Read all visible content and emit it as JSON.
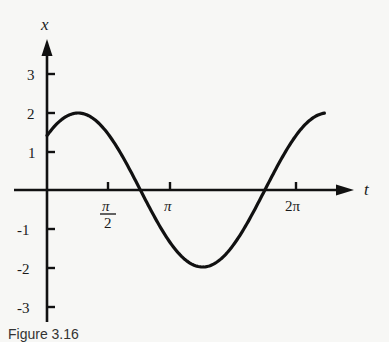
{
  "chart_data": {
    "type": "line",
    "title": "",
    "xlabel": "t",
    "ylabel": "x",
    "function": "x = 2cos(t - π/4)",
    "x_tick_labels": [
      "π/2",
      "π",
      "2π"
    ],
    "x_tick_values": [
      1.5708,
      3.1416,
      6.2832
    ],
    "y_tick_labels": [
      "3",
      "2",
      "1",
      "-1",
      "-2",
      "-3"
    ],
    "y_tick_values": [
      3,
      2,
      1,
      -1,
      -2,
      -3
    ],
    "xlim": [
      0,
      7.1
    ],
    "ylim": [
      -3,
      3.5
    ],
    "grid": false,
    "legend": null,
    "series": [
      {
        "name": "x(t)",
        "x": [
          0,
          0.3927,
          0.7854,
          1.1781,
          1.5708,
          1.9635,
          2.3562,
          2.7489,
          3.1416,
          3.5343,
          3.927,
          4.3197,
          4.7124,
          5.1051,
          5.4978,
          5.8905,
          6.2832
        ],
        "values": [
          1.41,
          1.85,
          2.0,
          1.85,
          1.41,
          0.77,
          0.0,
          -0.77,
          -1.41,
          -1.85,
          -2.0,
          -1.85,
          -1.41,
          -0.77,
          0.0,
          0.77,
          1.41
        ]
      }
    ],
    "key_points": {
      "start": [
        0,
        1.41
      ],
      "max": [
        0.7854,
        2.0
      ],
      "zero_1": [
        2.3562,
        0
      ],
      "min": [
        3.927,
        -2.0
      ],
      "zero_2": [
        5.4978,
        0
      ],
      "end": [
        6.4,
        1.9
      ]
    }
  },
  "axes": {
    "y_axis_label": "x",
    "x_axis_label": "t",
    "x_ticks": [
      {
        "label_num": "π",
        "label_den": "2"
      },
      {
        "label": "π"
      },
      {
        "label": "2π"
      }
    ],
    "y_ticks": [
      "3",
      "2",
      "1",
      "-1",
      "-2",
      "-3"
    ]
  },
  "caption": "Figure 3.16"
}
